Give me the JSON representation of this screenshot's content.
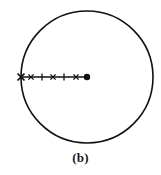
{
  "figure": {
    "caption": "(b)",
    "type": "geometric-diagram",
    "background_color": "#ffffff",
    "stroke_color": "#111111"
  },
  "circle": {
    "name": "outer-circle",
    "center_x": 87,
    "center_y": 77,
    "radius": 66,
    "stroke_color": "#111111",
    "stroke_width": 1.6,
    "fill": "none"
  },
  "radius_line": {
    "name": "radius-segment",
    "x1": 21,
    "y1": 77,
    "x2": 87,
    "y2": 77,
    "stroke_color": "#111111",
    "stroke_width": 1.3
  },
  "markers": [
    {
      "id": "cross-1",
      "symbol": "x",
      "x": 21,
      "y": 77,
      "size": 7.0,
      "stroke_width": 1.7,
      "label": "cross marker on circle boundary"
    },
    {
      "id": "cross-2",
      "symbol": "x",
      "x": 31,
      "y": 77,
      "size": 5.2,
      "stroke_width": 1.3,
      "label": "cross marker"
    },
    {
      "id": "tick-1",
      "symbol": "|",
      "x": 42,
      "y": 77,
      "size": 7.0,
      "stroke_width": 1.3,
      "label": "vertical tick marker"
    },
    {
      "id": "cross-3",
      "symbol": "x",
      "x": 53,
      "y": 77,
      "size": 5.2,
      "stroke_width": 1.3,
      "label": "cross marker"
    },
    {
      "id": "tick-2",
      "symbol": "|",
      "x": 64,
      "y": 77,
      "size": 7.0,
      "stroke_width": 1.3,
      "label": "vertical tick marker"
    },
    {
      "id": "cross-4",
      "symbol": "x",
      "x": 76,
      "y": 77,
      "size": 5.2,
      "stroke_width": 1.3,
      "label": "cross marker"
    },
    {
      "id": "dot-center",
      "symbol": "dot",
      "x": 87,
      "y": 77,
      "size": 3.2,
      "stroke_width": 0,
      "label": "filled dot at circle center"
    }
  ]
}
